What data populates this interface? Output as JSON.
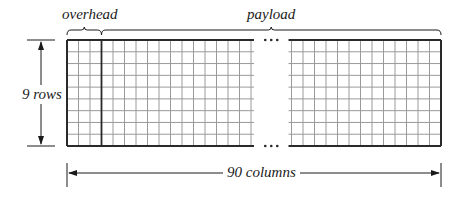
{
  "diagram": {
    "labels": {
      "overhead": "overhead",
      "payload": "payload",
      "rows": "9 rows",
      "columns": "90 columns",
      "ellipsis": "..."
    },
    "frame": {
      "rows": 9,
      "total_columns": 90,
      "overhead_columns": 3,
      "payload_columns": 87,
      "left_block_columns": 16,
      "right_block_columns": 13
    },
    "colors": {
      "grid_line": "#9a9a9a",
      "border_line": "#2a2a2a",
      "text": "#1a1a1a",
      "background": "#ffffff"
    }
  }
}
